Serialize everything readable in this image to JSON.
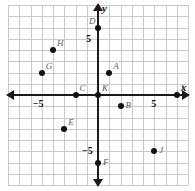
{
  "figure": {
    "type": "coordinate-plane",
    "axis_labels": {
      "x": "x",
      "y": "y"
    },
    "tick_labels": {
      "x_negative": "−5",
      "x_positive": "5",
      "y_positive": "5",
      "y_negative": "−5"
    },
    "axis_range": {
      "xmin": -8,
      "xmax": 8,
      "ymin": -8,
      "ymax": 8
    },
    "grid": true,
    "colors": {
      "grid": "#c9c9c9",
      "axis": "#1a1a1a",
      "point": "#111111",
      "point_label": "#5c5c5c",
      "background": "#ffffff"
    }
  },
  "chart_data": {
    "type": "scatter",
    "title": "",
    "xlabel": "x",
    "ylabel": "y",
    "xlim": [
      -8,
      8
    ],
    "ylim": [
      -8,
      8
    ],
    "grid": true,
    "points": [
      {
        "label": "A",
        "x": 1,
        "y": 2,
        "label_pos": "upper-right"
      },
      {
        "label": "B",
        "x": 2,
        "y": -1,
        "label_pos": "right"
      },
      {
        "label": "C",
        "x": -2,
        "y": 0,
        "label_pos": "upper-right"
      },
      {
        "label": "D",
        "x": 0,
        "y": 6,
        "label_pos": "upper-left"
      },
      {
        "label": "E",
        "x": -3,
        "y": -3,
        "label_pos": "upper-right"
      },
      {
        "label": "F",
        "x": 0,
        "y": -6,
        "label_pos": "right"
      },
      {
        "label": "G",
        "x": -5,
        "y": 2,
        "label_pos": "upper-right"
      },
      {
        "label": "H",
        "x": -4,
        "y": 4,
        "label_pos": "upper-right"
      },
      {
        "label": "I",
        "x": 7,
        "y": 0,
        "label_pos": "upper-right"
      },
      {
        "label": "J",
        "x": 5,
        "y": -5,
        "label_pos": "right"
      },
      {
        "label": "K",
        "x": 0,
        "y": 0,
        "label_pos": "upper-right"
      }
    ]
  }
}
